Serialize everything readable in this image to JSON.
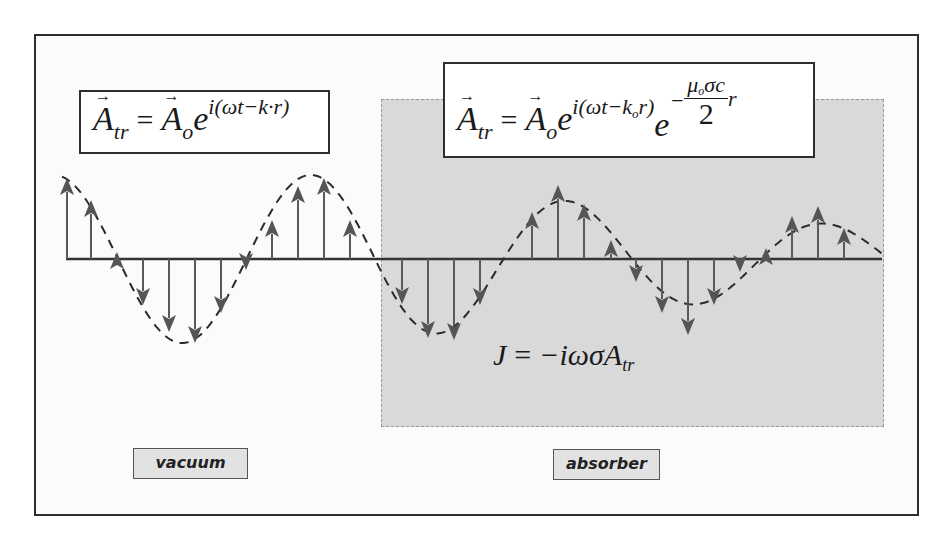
{
  "diagram": {
    "colors": {
      "frame": "#2e2e2e",
      "absorber_fill": "#d9d9d9",
      "arrow": "#555555",
      "axis": "#333333",
      "label_fill": "#e2e2e2"
    },
    "formulas": {
      "vacuum": {
        "lhs": "A",
        "lhs_sub": "tr",
        "eq": "=",
        "amp": "A",
        "amp_sub": "o",
        "base": "e",
        "exponent": "i(ωt−k·r)",
        "text": "A⃗_tr = A⃗_o e^{i(ωt−k·r)}"
      },
      "absorber": {
        "lhs": "A",
        "lhs_sub": "tr",
        "eq": "=",
        "amp": "A",
        "amp_sub": "o",
        "base": "e",
        "exponent": "i(ωt−k",
        "exponent_sub": "o",
        "exponent_tail": "r)",
        "base2": "e",
        "damp_sign": "−",
        "damp_num": "μ",
        "damp_num_sub": "o",
        "damp_num_tail": "σc",
        "damp_den": "2",
        "damp_tail": "r",
        "text": "A⃗_tr = A⃗_o e^{i(ωt−k_o r)} e^{−(μ_o σ c / 2) r}"
      },
      "current": {
        "lhs": "J",
        "eq": "=",
        "rhs": "−iωσA",
        "rhs_sub": "tr",
        "text": "J = −iωσA_tr"
      }
    },
    "labels": {
      "vacuum": "vacuum",
      "absorber": "absorber"
    },
    "wave": {
      "axis_y": 259,
      "axis_x_start": 66,
      "axis_x_end": 882,
      "vacuum_arrows": [
        {
          "x": 67,
          "tip": 178
        },
        {
          "x": 91,
          "tip": 200
        },
        {
          "x": 117,
          "tip": 252
        },
        {
          "x": 143,
          "tip": 305
        },
        {
          "x": 169,
          "tip": 332
        },
        {
          "x": 195,
          "tip": 343
        },
        {
          "x": 221,
          "tip": 313
        },
        {
          "x": 246,
          "tip": 270
        },
        {
          "x": 272,
          "tip": 220
        },
        {
          "x": 298,
          "tip": 186
        },
        {
          "x": 324,
          "tip": 178
        },
        {
          "x": 350,
          "tip": 220
        }
      ],
      "absorber_arrows": [
        {
          "x": 402,
          "tip": 304
        },
        {
          "x": 428,
          "tip": 338
        },
        {
          "x": 454,
          "tip": 340
        },
        {
          "x": 480,
          "tip": 305
        },
        {
          "x": 532,
          "tip": 212
        },
        {
          "x": 558,
          "tip": 185
        },
        {
          "x": 584,
          "tip": 204
        },
        {
          "x": 611,
          "tip": 240
        },
        {
          "x": 636,
          "tip": 282
        },
        {
          "x": 662,
          "tip": 313
        },
        {
          "x": 688,
          "tip": 335
        },
        {
          "x": 714,
          "tip": 305
        },
        {
          "x": 740,
          "tip": 272
        },
        {
          "x": 766,
          "tip": 248
        },
        {
          "x": 792,
          "tip": 216
        },
        {
          "x": 818,
          "tip": 206
        },
        {
          "x": 844,
          "tip": 228
        }
      ]
    }
  }
}
